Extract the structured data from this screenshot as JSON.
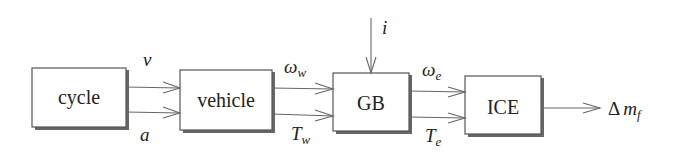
{
  "diagram": {
    "type": "block-diagram",
    "blocks": [
      {
        "id": "cycle",
        "label": "cycle"
      },
      {
        "id": "vehicle",
        "label": "vehicle"
      },
      {
        "id": "gb",
        "label": "GB"
      },
      {
        "id": "ice",
        "label": "ICE"
      }
    ],
    "signals": {
      "cycle_to_vehicle": {
        "top": {
          "symbol": "v",
          "sub": ""
        },
        "bottom": {
          "symbol": "a",
          "sub": ""
        }
      },
      "vehicle_to_gb": {
        "top": {
          "symbol": "ω",
          "sub": "w"
        },
        "bottom": {
          "symbol": "T",
          "sub": "w"
        }
      },
      "gb_to_ice": {
        "top": {
          "symbol": "ω",
          "sub": "e"
        },
        "bottom": {
          "symbol": "T",
          "sub": "e"
        }
      },
      "gb_input": {
        "symbol": "i"
      },
      "ice_output": {
        "prefix": "Δ",
        "symbol": "m",
        "sub": "f"
      }
    }
  }
}
